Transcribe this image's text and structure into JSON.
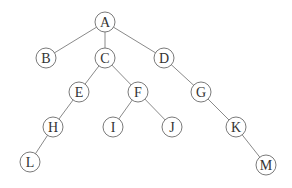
{
  "diagram": {
    "type": "tree",
    "node_radius": 10,
    "colors": {
      "edge": "#8a8a8a",
      "node_stroke": "#7a7a7a",
      "node_fill": "#ffffff",
      "label": "#333333"
    },
    "nodes": [
      {
        "id": "A",
        "label": "A",
        "x": 105,
        "y": 22
      },
      {
        "id": "B",
        "label": "B",
        "x": 46,
        "y": 58
      },
      {
        "id": "C",
        "label": "C",
        "x": 105,
        "y": 58
      },
      {
        "id": "D",
        "label": "D",
        "x": 164,
        "y": 58
      },
      {
        "id": "E",
        "label": "E",
        "x": 79,
        "y": 92
      },
      {
        "id": "F",
        "label": "F",
        "x": 138,
        "y": 92
      },
      {
        "id": "G",
        "label": "G",
        "x": 201,
        "y": 92
      },
      {
        "id": "H",
        "label": "H",
        "x": 53,
        "y": 127
      },
      {
        "id": "I",
        "label": "I",
        "x": 113,
        "y": 127
      },
      {
        "id": "J",
        "label": "J",
        "x": 172,
        "y": 127
      },
      {
        "id": "K",
        "label": "K",
        "x": 236,
        "y": 127
      },
      {
        "id": "L",
        "label": "L",
        "x": 30,
        "y": 162
      },
      {
        "id": "M",
        "label": "M",
        "x": 266,
        "y": 165
      }
    ],
    "edges": [
      [
        "A",
        "B"
      ],
      [
        "A",
        "C"
      ],
      [
        "A",
        "D"
      ],
      [
        "C",
        "E"
      ],
      [
        "C",
        "F"
      ],
      [
        "D",
        "G"
      ],
      [
        "E",
        "H"
      ],
      [
        "F",
        "I"
      ],
      [
        "F",
        "J"
      ],
      [
        "G",
        "K"
      ],
      [
        "H",
        "L"
      ],
      [
        "K",
        "M"
      ]
    ]
  }
}
